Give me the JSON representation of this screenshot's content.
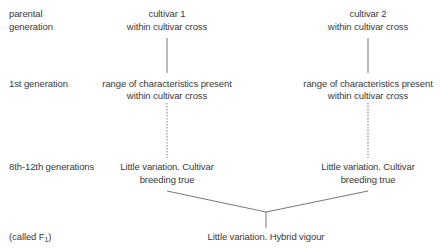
{
  "row_labels": {
    "parental_line1": "parental",
    "parental_line2": "generation",
    "first": "1st generation",
    "later": "8th-12th generations",
    "f1_prefix": "(called F",
    "f1_sub": "1",
    "f1_suffix": ")"
  },
  "left_branch": {
    "parent_line1": "cultivar 1",
    "parent_line2": "within cultivar cross",
    "first_line1": "range of characteristics present",
    "first_line2": "within cultivar cross",
    "later_line1": "Little variation. Cultivar",
    "later_line2": "breeding true"
  },
  "right_branch": {
    "parent_line1": "cultivar 2",
    "parent_line2": "within cultivar cross",
    "first_line1": "range of characteristics present",
    "first_line2": "within cultivar cross",
    "later_line1": "Little variation. Cultivar",
    "later_line2": "breeding true"
  },
  "hybrid": {
    "label": "Little variation. Hybrid vigour"
  },
  "colors": {
    "text": "#3a3a3a",
    "line": "#555555"
  }
}
